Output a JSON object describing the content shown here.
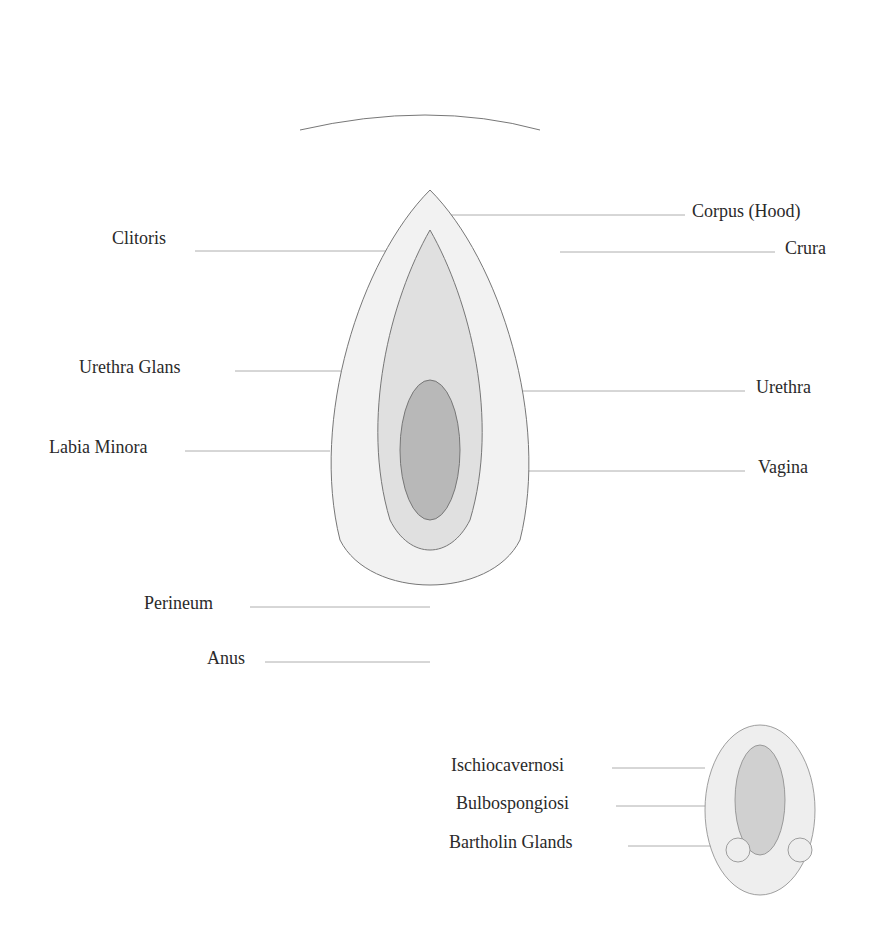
{
  "main_labels_left": [
    {
      "text": "Clitoris",
      "x": 112,
      "y": 228
    },
    {
      "text": "Urethra Glans",
      "x": 79,
      "y": 357
    },
    {
      "text": "Labia Minora",
      "x": 49,
      "y": 437
    },
    {
      "text": "Perineum",
      "x": 144,
      "y": 593
    },
    {
      "text": "Anus",
      "x": 207,
      "y": 648
    }
  ],
  "main_labels_right": [
    {
      "text": "Corpus (Hood)",
      "x": 692,
      "y": 201
    },
    {
      "text": "Crura",
      "x": 785,
      "y": 238
    },
    {
      "text": "Urethra",
      "x": 756,
      "y": 377
    },
    {
      "text": "Vagina",
      "x": 758,
      "y": 457
    }
  ],
  "inset_labels": [
    {
      "text": "Ischiocavernosi",
      "x": 451,
      "y": 755
    },
    {
      "text": "Bulbospongiosi",
      "x": 456,
      "y": 793
    },
    {
      "text": "Bartholin Glands",
      "x": 449,
      "y": 832
    }
  ]
}
